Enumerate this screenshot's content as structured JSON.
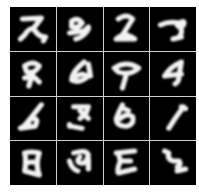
{
  "figure": {
    "rows": 4,
    "cols": 4,
    "background_color": "#000000",
    "stroke_color": "#f2f2f2",
    "separator_color": "#cfcfcf"
  },
  "samples": [
    {
      "row": 0,
      "col": 0,
      "resembles": "2/7 hybrid",
      "path": "M12 12 L30 11 L22 22 M14 28 Q20 18 24 24 Q28 30 34 30 L32 34 M14 28 L10 32"
    },
    {
      "row": 0,
      "col": 1,
      "resembles": "9-like",
      "path": "M14 14 Q20 10 24 16 Q20 22 14 20 Z M12 26 L26 24 L30 20 M30 22 Q26 30 18 32"
    },
    {
      "row": 0,
      "col": 2,
      "resembles": "2-like",
      "path": "M14 12 Q22 6 28 12 L18 28 M12 32 Q20 24 30 32 L12 32 M18 28 Q22 26 24 30"
    },
    {
      "row": 0,
      "col": 3,
      "resembles": "7-like",
      "path": "M10 18 Q18 14 28 16 Q34 12 32 18 Q28 22 26 18 M30 18 L30 26 Q28 32 22 32 L30 30"
    },
    {
      "row": 1,
      "col": 0,
      "resembles": "9/8-like",
      "path": "M14 14 Q22 8 28 14 Q24 22 16 20 Z M22 20 L18 34 M22 24 L28 30 M14 26 L22 24"
    },
    {
      "row": 1,
      "col": 1,
      "resembles": "6-like",
      "path": "M26 10 Q14 20 14 28 Q22 32 30 24 L24 22 Q18 24 16 26 M30 12 L32 24"
    },
    {
      "row": 1,
      "col": 2,
      "resembles": "9-like",
      "path": "M10 16 Q22 8 34 16 Q26 24 14 20 Z M22 22 L18 36"
    },
    {
      "row": 1,
      "col": 3,
      "resembles": "4/9-like",
      "path": "M30 10 Q20 14 14 24 L30 22 M30 10 L28 22 Q28 30 24 32"
    },
    {
      "row": 2,
      "col": 0,
      "resembles": "6/4 hybrid",
      "path": "M30 8 L18 24 Q14 30 10 32 L24 30 Q28 22 22 22 Q16 24 18 28"
    },
    {
      "row": 2,
      "col": 1,
      "resembles": "7/5 hybrid",
      "path": "M16 10 L30 10 L28 16 L22 22 M22 14 L30 22 M14 30 L24 32 M12 28 L12 30"
    },
    {
      "row": 2,
      "col": 2,
      "resembles": "6/8-like",
      "path": "M18 8 Q14 16 12 22 Q12 30 22 30 Q30 28 28 20 Q22 16 16 22 M20 12 L24 14"
    },
    {
      "row": 2,
      "col": 3,
      "resembles": "1-like",
      "path": "M32 10 L24 22 L18 32 M30 10 L34 12"
    },
    {
      "row": 3,
      "col": 0,
      "resembles": "8-like",
      "path": "M14 12 Q16 20 14 30 L28 34 Q24 24 28 12 Q20 10 14 12 M16 22 Q22 20 26 22"
    },
    {
      "row": 3,
      "col": 1,
      "resembles": "3/9-like",
      "path": "M16 12 Q28 8 30 14 Q28 24 22 22 Q18 20 22 16 M30 18 L30 28 M12 20 Q14 28 20 30"
    },
    {
      "row": 3,
      "col": 2,
      "resembles": "3/E-like",
      "path": "M12 12 L30 10 M14 12 L16 20 L26 20 M16 20 Q12 30 14 32 L30 28"
    },
    {
      "row": 3,
      "col": 3,
      "resembles": "5-like",
      "path": "M14 10 L18 12 Q16 18 22 20 L28 20 Q30 24 26 26 M26 30 L34 28"
    }
  ]
}
